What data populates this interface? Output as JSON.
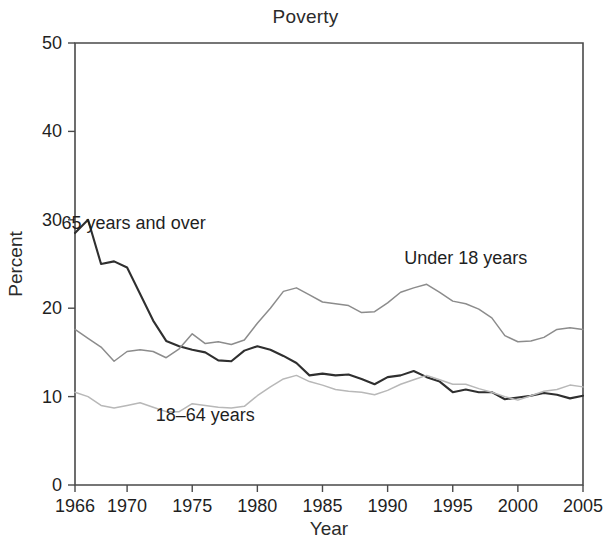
{
  "chart_data": {
    "type": "line",
    "title": "Poverty",
    "xlabel": "Year",
    "ylabel": "Percent",
    "xlim": [
      1966,
      2005
    ],
    "ylim": [
      0,
      50
    ],
    "grid": false,
    "legend_position": "inline-annotations",
    "xticks": [
      1966,
      1970,
      1975,
      1980,
      1985,
      1990,
      1995,
      2000,
      2005
    ],
    "xtick_labels": [
      "1966",
      "1970",
      "1975",
      "1980",
      "1985",
      "1990",
      "1995",
      "2000",
      "2005"
    ],
    "yticks": [
      0,
      10,
      20,
      30,
      40,
      50
    ],
    "ytick_labels": [
      "0",
      "10",
      "20",
      "30",
      "40",
      "50"
    ],
    "x": [
      1966,
      1967,
      1968,
      1969,
      1970,
      1971,
      1972,
      1973,
      1974,
      1975,
      1976,
      1977,
      1978,
      1979,
      1980,
      1981,
      1982,
      1983,
      1984,
      1985,
      1986,
      1987,
      1988,
      1989,
      1990,
      1991,
      1992,
      1993,
      1994,
      1995,
      1996,
      1997,
      1998,
      1999,
      2000,
      2001,
      2002,
      2003,
      2004,
      2005
    ],
    "series": [
      {
        "name": "65 years and over",
        "color": "#2f2f2f",
        "width": 2.1,
        "label_x": 1970.5,
        "label_y": 29.0,
        "values": [
          28.5,
          30.0,
          25.0,
          25.3,
          24.6,
          21.6,
          18.6,
          16.3,
          15.7,
          15.3,
          15.0,
          14.1,
          14.0,
          15.2,
          15.7,
          15.3,
          14.6,
          13.8,
          12.4,
          12.6,
          12.4,
          12.5,
          12.0,
          11.4,
          12.2,
          12.4,
          12.9,
          12.2,
          11.7,
          10.5,
          10.8,
          10.5,
          10.5,
          9.7,
          9.9,
          10.1,
          10.4,
          10.2,
          9.8,
          10.1
        ]
      },
      {
        "name": "Under 18 years",
        "color": "#8c8c8c",
        "width": 1.5,
        "label_x": 1996.0,
        "label_y": 25.0,
        "values": [
          17.6,
          16.6,
          15.6,
          14.0,
          15.1,
          15.3,
          15.1,
          14.4,
          15.4,
          17.1,
          16.0,
          16.2,
          15.9,
          16.4,
          18.3,
          20.0,
          21.9,
          22.3,
          21.5,
          20.7,
          20.5,
          20.3,
          19.5,
          19.6,
          20.6,
          21.8,
          22.3,
          22.7,
          21.8,
          20.8,
          20.5,
          19.9,
          18.9,
          16.9,
          16.2,
          16.3,
          16.7,
          17.6,
          17.8,
          17.6
        ]
      },
      {
        "name": "18–64 years",
        "color": "#b8b8b8",
        "width": 1.5,
        "label_x": 1976.0,
        "label_y": 7.2,
        "values": [
          10.5,
          10.0,
          9.0,
          8.7,
          9.0,
          9.3,
          8.8,
          8.3,
          8.3,
          9.2,
          9.0,
          8.8,
          8.7,
          8.9,
          10.1,
          11.1,
          12.0,
          12.4,
          11.7,
          11.3,
          10.8,
          10.6,
          10.5,
          10.2,
          10.7,
          11.4,
          11.9,
          12.4,
          11.9,
          11.4,
          11.4,
          10.9,
          10.5,
          10.0,
          9.6,
          10.1,
          10.6,
          10.8,
          11.3,
          11.1
        ]
      }
    ]
  },
  "figure": {
    "title": "Poverty",
    "xlabel": "Year",
    "ylabel": "Percent"
  }
}
